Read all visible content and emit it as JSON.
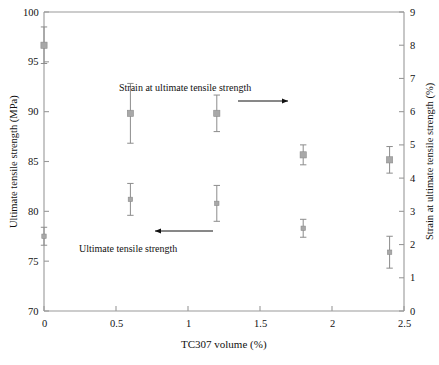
{
  "chart_data": {
    "type": "scatter",
    "title": "",
    "xlabel": "TC307 volume (%)",
    "ylabel": "Ultimate tensile strength (MPa)",
    "y2label": "Strain at ultimate tensile strength (%)",
    "xlim": [
      0,
      2.5
    ],
    "ylim": [
      70,
      100
    ],
    "y2lim": [
      0,
      9
    ],
    "xticks": [
      0,
      0.5,
      1,
      1.5,
      2,
      2.5
    ],
    "xticklabels": [
      "0",
      "0.5",
      "1",
      "1.5",
      "2",
      "2.5"
    ],
    "yticks": [
      70,
      75,
      80,
      85,
      90,
      95,
      100
    ],
    "yticklabels": [
      "70",
      "75",
      "80",
      "85",
      "90",
      "95",
      "100"
    ],
    "y2ticks": [
      0,
      1,
      2,
      3,
      4,
      5,
      6,
      7,
      8,
      9
    ],
    "y2ticklabels": [
      "0",
      "1",
      "2",
      "3",
      "4",
      "5",
      "6",
      "7",
      "8",
      "9"
    ],
    "grid": false,
    "legend": "none",
    "marker": "square",
    "marker_color": "#a8a8a8",
    "errorbar_color": "#8c8c8c",
    "axis_color": "#999999",
    "x": [
      0,
      0.6,
      1.2,
      1.8,
      2.4
    ],
    "series": [
      {
        "name": "Ultimate tensile strength",
        "axis": "left",
        "units": "MPa",
        "values": [
          77.5,
          81.2,
          80.8,
          78.3,
          75.9
        ],
        "errors": [
          0.9,
          1.6,
          1.8,
          0.9,
          1.6
        ]
      },
      {
        "name": "Strain at ultimate tensile strength",
        "axis": "right",
        "units": "%",
        "values": [
          8.0,
          5.95,
          5.95,
          4.7,
          4.55
        ],
        "errors": [
          0.55,
          0.9,
          0.55,
          0.3,
          0.4
        ]
      }
    ],
    "annotations": [
      {
        "id": "strain-annotation",
        "text": "Strain at ultimate tensile strength",
        "text_x": 185,
        "text_y": 82,
        "arrow": {
          "x1": 238,
          "y1": 101,
          "x2": 288,
          "y2": 101,
          "direction": "right"
        }
      },
      {
        "id": "uts-annotation",
        "text": "Ultimate tensile strength",
        "text_x": 128,
        "text_y": 243,
        "arrow": {
          "x1": 213,
          "y1": 231,
          "x2": 155,
          "y2": 231,
          "direction": "left"
        }
      }
    ]
  }
}
